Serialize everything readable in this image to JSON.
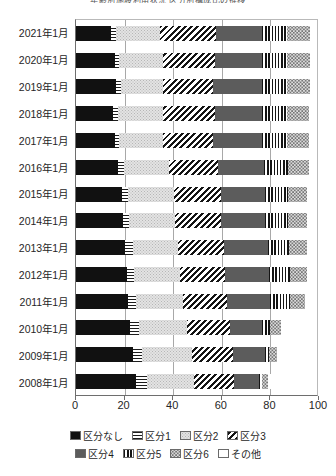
{
  "chart": {
    "title": "年齢別施設利用状況 区分別構成比の推移",
    "xlabel": "",
    "ylabel": ""
  },
  "axis": {
    "x_ticks": [
      "0",
      "20",
      "40",
      "60",
      "80",
      "100"
    ]
  },
  "legend": {
    "rows": [
      [
        {
          "label": "区分なし",
          "pattern": "p-none",
          "swatch_name": "legend-swatch-kubun-nashi"
        },
        {
          "label": "区分1",
          "pattern": "p-k1",
          "swatch_name": "legend-swatch-kubun-1"
        },
        {
          "label": "区分2",
          "pattern": "p-k2",
          "swatch_name": "legend-swatch-kubun-2"
        },
        {
          "label": "区分3",
          "pattern": "p-k3",
          "swatch_name": "legend-swatch-kubun-3"
        }
      ],
      [
        {
          "label": "区分4",
          "pattern": "p-k4",
          "swatch_name": "legend-swatch-kubun-4"
        },
        {
          "label": "区分5",
          "pattern": "p-k5",
          "swatch_name": "legend-swatch-kubun-5"
        },
        {
          "label": "区分6",
          "pattern": "p-k6",
          "swatch_name": "legend-swatch-kubun-6"
        },
        {
          "label": "その他",
          "pattern": "p-other",
          "swatch_name": "legend-swatch-sonota"
        }
      ]
    ]
  },
  "chart_data": {
    "type": "bar",
    "orientation": "horizontal",
    "stacked": true,
    "title": "年齢別施設利用状況 区分別構成比の推移",
    "xlabel": "",
    "ylabel": "",
    "xlim": [
      0,
      100
    ],
    "grid": true,
    "legend_position": "bottom",
    "categories": [
      "2021年1月",
      "2020年1月",
      "2019年1月",
      "2018年1月",
      "2017年1月",
      "2016年1月",
      "2015年1月",
      "2014年1月",
      "2013年1月",
      "2012年1月",
      "2011年1月",
      "2010年1月",
      "2009年1月",
      "2008年1月"
    ],
    "series": [
      {
        "name": "区分なし",
        "pattern": "p-none",
        "values": [
          14.5,
          16.0,
          16.5,
          15.5,
          16.0,
          17.5,
          19.0,
          19.5,
          20.5,
          21.0,
          21.5,
          22.5,
          23.5,
          25.0
        ]
      },
      {
        "name": "区分1",
        "pattern": "p-k1",
        "values": [
          2.0,
          2.0,
          2.0,
          2.0,
          2.0,
          2.5,
          2.5,
          2.5,
          3.0,
          3.0,
          3.5,
          3.5,
          4.0,
          4.5
        ]
      },
      {
        "name": "区分2",
        "pattern": "p-k2",
        "values": [
          18.5,
          18.0,
          17.5,
          18.5,
          18.0,
          18.5,
          19.0,
          19.0,
          19.0,
          19.0,
          19.5,
          20.0,
          20.5,
          19.5
        ]
      },
      {
        "name": "区分3",
        "pattern": "p-k3",
        "values": [
          23.0,
          21.5,
          21.0,
          21.5,
          21.0,
          20.5,
          19.5,
          19.0,
          19.0,
          19.0,
          18.0,
          18.0,
          17.0,
          16.5
        ]
      },
      {
        "name": "区分4",
        "pattern": "p-k4",
        "values": [
          19.0,
          19.5,
          20.0,
          19.5,
          20.0,
          19.0,
          18.5,
          18.5,
          18.0,
          18.0,
          18.0,
          13.0,
          13.5,
          10.5
        ]
      },
      {
        "name": "区分5",
        "pattern": "p-k5",
        "values": [
          10.5,
          10.5,
          10.5,
          10.5,
          10.5,
          10.0,
          9.5,
          9.5,
          9.0,
          9.0,
          8.5,
          3.5,
          1.5,
          1.0
        ]
      },
      {
        "name": "区分6",
        "pattern": "p-k6",
        "values": [
          9.5,
          9.5,
          9.5,
          9.0,
          9.0,
          8.5,
          8.0,
          8.0,
          7.5,
          7.0,
          6.0,
          4.5,
          3.5,
          2.5
        ]
      },
      {
        "name": "その他",
        "pattern": "p-other",
        "values": [
          3.0,
          3.0,
          3.0,
          3.5,
          3.5,
          3.5,
          4.0,
          4.0,
          4.0,
          4.0,
          5.0,
          15.0,
          16.5,
          20.5
        ]
      }
    ]
  }
}
